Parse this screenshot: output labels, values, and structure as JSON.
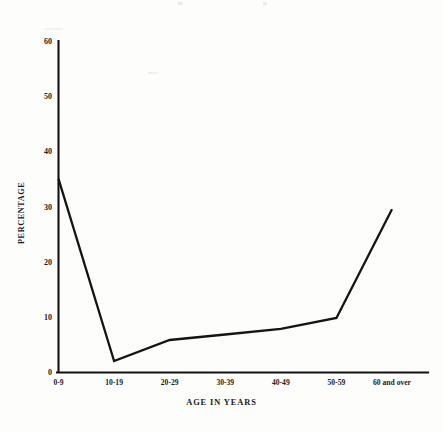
{
  "chart_data": {
    "type": "line",
    "title": "",
    "subtitle": "",
    "xlabel": "AGE IN YEARS",
    "ylabel": "PERCENTAGE",
    "categories": [
      "0-9",
      "10-19",
      "20-29",
      "30-39",
      "40-49",
      "50-59",
      "60 and over"
    ],
    "values": [
      35,
      2,
      5.8,
      6.8,
      7.8,
      9.8,
      29.5
    ],
    "series": [
      {
        "name": "",
        "values": [
          35,
          2,
          5.8,
          6.8,
          7.8,
          9.8,
          29.5
        ]
      }
    ],
    "ylim": [
      0,
      60
    ],
    "y_ticks": [
      0,
      10,
      20,
      30,
      40,
      50,
      60
    ],
    "y_tick_labels": [
      "0",
      "10",
      "20",
      "30",
      "40",
      "50",
      "60"
    ],
    "x_tick_labels": [
      "0-9",
      "10-19",
      "20-29",
      "30-39",
      "40-49",
      "50-59",
      "60 and over"
    ],
    "grid": false,
    "legend": false,
    "legend_position": "none",
    "annotations": [],
    "line_color": "#141414",
    "axis_color": "#111111",
    "background_color": "#fdfdfc"
  }
}
